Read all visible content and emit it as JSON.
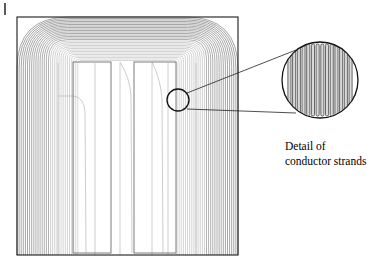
{
  "figure": {
    "name": "magnetic-flux-plot-with-conductor-strand-detail",
    "background_color": "#ffffff",
    "width": 380,
    "height": 280
  },
  "annotations": {
    "detail_label_line1": "Detail of",
    "detail_label_line2": "conductor strands",
    "label_x": 285,
    "label_y1": 150,
    "label_y2": 165
  },
  "colors": {
    "outline": "#1a1a1a",
    "flux_line": "#8c8c8c",
    "flux_line_faint": "#b8b8b8",
    "coil_outline": "#6e6e6e",
    "strand_fill": "#d9d9d9",
    "strand_outline": "#3a3a3a",
    "callout_circle": "#111111",
    "leader_line": "#222222",
    "tick_mark": "#333333"
  },
  "main_plot": {
    "name": "core-window-flux-region",
    "outer_box": {
      "x": 17,
      "y": 17,
      "width": 221,
      "height": 238
    },
    "flux_contours": {
      "type": "nested-rounded-rectangles",
      "count": 30,
      "description": "nested magnetic flux contour lines rounding the top-left and top-right corners of the core window, densest along the left limb",
      "corner_radius_outer": 52,
      "corner_radius_inner": 3,
      "inset_step_x": 2.1,
      "inset_step_y": 1.5
    },
    "coil_rectangles": [
      {
        "name": "coil-winding-left",
        "x": 73,
        "y": 62,
        "width": 38,
        "height": 191
      },
      {
        "name": "coil-winding-right",
        "x": 134,
        "y": 62,
        "width": 42,
        "height": 191
      }
    ],
    "interior_field_lines_x": [
      58,
      95,
      120,
      152,
      168,
      196
    ],
    "callout_source_circle": {
      "cx": 178,
      "cy": 100,
      "r": 11
    }
  },
  "detail_view": {
    "name": "conductor-strand-detail",
    "circle": {
      "cx": 320,
      "cy": 80,
      "r": 38
    },
    "strand_count": 14,
    "strand_width": 3.1,
    "strand_gap": 1.6,
    "strand_top": 44,
    "strand_bottom": 116,
    "strand_corner_radius": 1.4
  },
  "leader_lines": [
    {
      "name": "leader-line-upper",
      "x1": 187,
      "y1": 93,
      "x2": 296,
      "y2": 50
    },
    {
      "name": "leader-line-lower",
      "x1": 187,
      "y1": 109,
      "x2": 296,
      "y2": 113
    }
  ],
  "tick_mark": {
    "name": "crop-tick-mark",
    "x": 5,
    "y": 3,
    "height": 12
  }
}
